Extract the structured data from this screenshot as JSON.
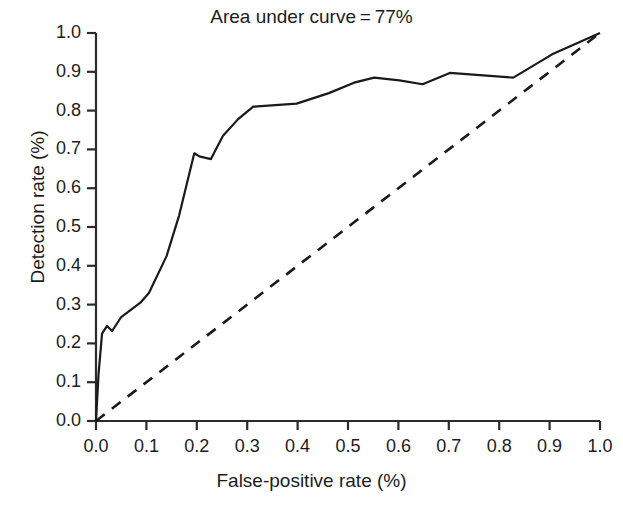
{
  "chart_data": {
    "type": "line",
    "title": "Area under curve = 77%",
    "xlabel": "False-positive rate (%)",
    "ylabel": "Detection rate (%)",
    "xlim": [
      0.0,
      1.0
    ],
    "ylim": [
      0.0,
      1.0
    ],
    "grid": false,
    "legend": "none",
    "xticks": [
      "0.0",
      "0.1",
      "0.2",
      "0.3",
      "0.4",
      "0.5",
      "0.6",
      "0.7",
      "0.8",
      "0.9",
      "1.0"
    ],
    "yticks": [
      "0.0",
      "0.1",
      "0.2",
      "0.3",
      "0.4",
      "0.5",
      "0.6",
      "0.7",
      "0.8",
      "0.9",
      "1.0"
    ],
    "xtick_values": [
      0.0,
      0.1,
      0.2,
      0.3,
      0.4,
      0.5,
      0.6,
      0.7,
      0.8,
      0.9,
      1.0
    ],
    "ytick_values": [
      0.0,
      0.1,
      0.2,
      0.3,
      0.4,
      0.5,
      0.6,
      0.7,
      0.8,
      0.9,
      1.0
    ],
    "annotations": [
      {
        "text": "Area under curve = 77%",
        "position": "top-center",
        "value": 0.77
      }
    ],
    "series": [
      {
        "name": "ROC curve",
        "style": "solid",
        "color": "#1a1a1a",
        "width": 2.2,
        "points": [
          [
            0.0,
            0.0
          ],
          [
            0.005,
            0.12
          ],
          [
            0.012,
            0.225
          ],
          [
            0.022,
            0.245
          ],
          [
            0.032,
            0.232
          ],
          [
            0.05,
            0.268
          ],
          [
            0.088,
            0.305
          ],
          [
            0.105,
            0.33
          ],
          [
            0.14,
            0.425
          ],
          [
            0.165,
            0.53
          ],
          [
            0.195,
            0.69
          ],
          [
            0.205,
            0.682
          ],
          [
            0.228,
            0.675
          ],
          [
            0.252,
            0.735
          ],
          [
            0.282,
            0.778
          ],
          [
            0.312,
            0.81
          ],
          [
            0.398,
            0.818
          ],
          [
            0.462,
            0.845
          ],
          [
            0.512,
            0.872
          ],
          [
            0.552,
            0.885
          ],
          [
            0.602,
            0.878
          ],
          [
            0.648,
            0.868
          ],
          [
            0.702,
            0.897
          ],
          [
            0.828,
            0.885
          ],
          [
            0.905,
            0.945
          ],
          [
            1.0,
            1.0
          ]
        ]
      },
      {
        "name": "Chance diagonal",
        "style": "dashed",
        "color": "#1a1a1a",
        "width": 2.6,
        "dash": "11 9",
        "points": [
          [
            0.0,
            0.0
          ],
          [
            1.0,
            1.0
          ]
        ]
      }
    ]
  },
  "bottom_text": {
    "caption_fragment": ""
  }
}
